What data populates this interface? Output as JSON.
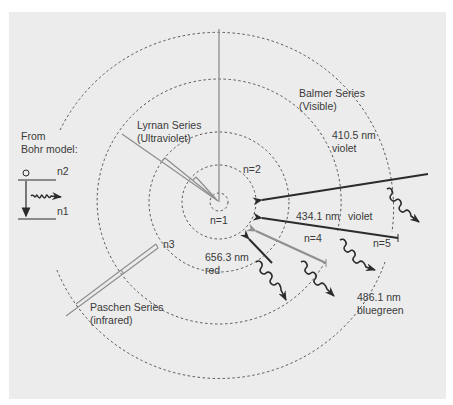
{
  "diagram": {
    "colors": {
      "background": "#ececec",
      "page": "#ffffff",
      "dark_line": "#2b2b2b",
      "gray_line": "#8f8f8f",
      "dashed_circle": "#555555",
      "text": "#3a3a3a"
    },
    "legend": {
      "line1": "From",
      "line2": "Bohr model:",
      "upper_level": "n2",
      "lower_level": "n1"
    },
    "levels": [
      {
        "label": "n=1",
        "radius": 9
      },
      {
        "label": "n=2",
        "radius": 37
      },
      {
        "label": "n3",
        "radius": 70
      },
      {
        "label": "n=4",
        "radius": 122
      },
      {
        "label": "n=5",
        "radius": 176
      }
    ],
    "series": {
      "lyman": {
        "name": "Lyrnan Series",
        "band": "(Ultraviolet)"
      },
      "balmer": {
        "name": "Balmer Series",
        "band": "(Visible)"
      },
      "paschen": {
        "name": "Paschen Series",
        "band": "(infrared)"
      }
    },
    "transitions": [
      {
        "wavelength": "410.5 nm",
        "color": "violet"
      },
      {
        "wavelength": "434.1 nm",
        "color": "violet"
      },
      {
        "wavelength": "486.1 nm",
        "color": "bluegreen"
      },
      {
        "wavelength": "656.3 nm",
        "color": "red"
      }
    ]
  }
}
